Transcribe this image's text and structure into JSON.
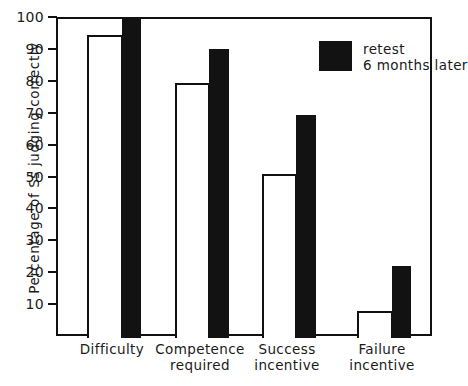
{
  "chart_data": {
    "type": "bar",
    "title": "",
    "subtitle": "",
    "xlabel": "",
    "ylabel": "Percentage of Ss judging correctly",
    "ylim": [
      0,
      100
    ],
    "yticks": [
      10,
      20,
      30,
      40,
      50,
      60,
      70,
      80,
      90,
      100
    ],
    "ytick_labels": [
      "10",
      "20",
      "30",
      "40",
      "50",
      "60",
      "70",
      "80",
      "90",
      "100"
    ],
    "grid": false,
    "legend_position": "top-right",
    "categories": [
      "Difficulty",
      "Competence required",
      "Success incentive",
      "Failure incentive"
    ],
    "category_lines": [
      [
        "Difficulty"
      ],
      [
        "Competence",
        "required"
      ],
      [
        "Success",
        "incentive"
      ],
      [
        "Failure",
        "incentive"
      ]
    ],
    "series": [
      {
        "name": "test",
        "style": "open-white-bar",
        "color": "#ffffff",
        "edge_color": "#111111",
        "values": [
          95,
          80,
          51.5,
          8.5
        ]
      },
      {
        "name": "retest 6 months later",
        "style": "solid-black-bar",
        "color": "#121212",
        "edge_color": "#121212",
        "values": [
          100,
          90.5,
          70,
          22.5
        ]
      }
    ],
    "legend": [
      {
        "swatch": "black",
        "line_1": "retest",
        "line_2": "6 months later"
      }
    ]
  },
  "axes": {
    "y_title": "Percentage of Ss judging correctly"
  },
  "legend": {
    "line_1": "retest",
    "line_2": "6 months later"
  }
}
